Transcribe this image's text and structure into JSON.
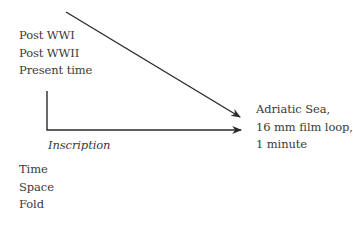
{
  "diagram": {
    "left_top_list": [
      "Post WWI",
      "Post WWII",
      "Present time"
    ],
    "target_text": [
      "Adriatic Sea,",
      "16 mm film loop,",
      "1 minute"
    ],
    "edge_label": "Inscription",
    "left_bottom_list": [
      "Time",
      "Space",
      "Fold"
    ],
    "line_color": "#2b2b2b",
    "arrows": [
      {
        "name": "diagonal-arrow",
        "from": [
          66,
          12
        ],
        "to": [
          240,
          117
        ]
      },
      {
        "name": "elbow-arrow",
        "points": [
          [
            47,
            91
          ],
          [
            47,
            130
          ],
          [
            241,
            130
          ]
        ]
      }
    ]
  }
}
